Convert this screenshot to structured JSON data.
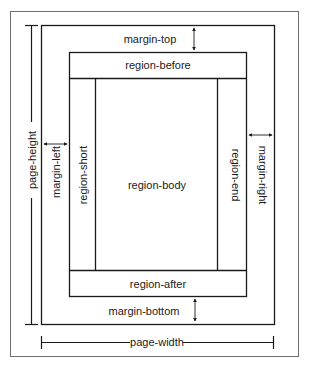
{
  "diagram": {
    "colors": {
      "line": "#1a1a1a",
      "outer_border": "#6e6e6e",
      "background": "#ffffff"
    },
    "labels": {
      "margin_top": "margin-top",
      "region_before": "region-before",
      "region_short": "region-short",
      "region_body": "region-body",
      "region_end": "region-end",
      "region_after": "region-after",
      "margin_bottom": "margin-bottom",
      "margin_left": "margin-left",
      "margin_right": "margin-right",
      "page_height": "page-height",
      "page_width": "page-width"
    }
  }
}
